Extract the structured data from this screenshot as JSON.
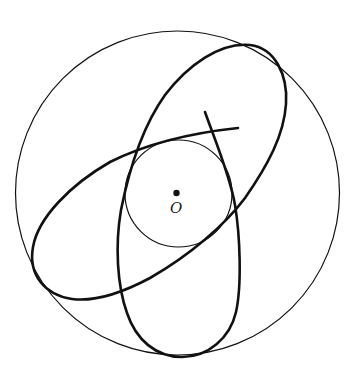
{
  "diagram": {
    "colors": {
      "background": "#ffffff",
      "stroke": "#111111"
    },
    "outer_circle": {
      "cx": 177.5,
      "cy": 193,
      "r": 162,
      "stroke_width": 1.2
    },
    "inner_circle": {
      "cx": 178.5,
      "cy": 193.5,
      "r": 53.5,
      "stroke_width": 1.2
    },
    "center_point": {
      "cx": 176.5,
      "cy": 193,
      "r": 3.2
    },
    "center_label": {
      "text": "O",
      "x": 171,
      "y": 201
    },
    "orbit_path": {
      "stroke_width": 2.6,
      "start": [
        205,
        112
      ],
      "end": [
        238,
        128
      ]
    }
  }
}
